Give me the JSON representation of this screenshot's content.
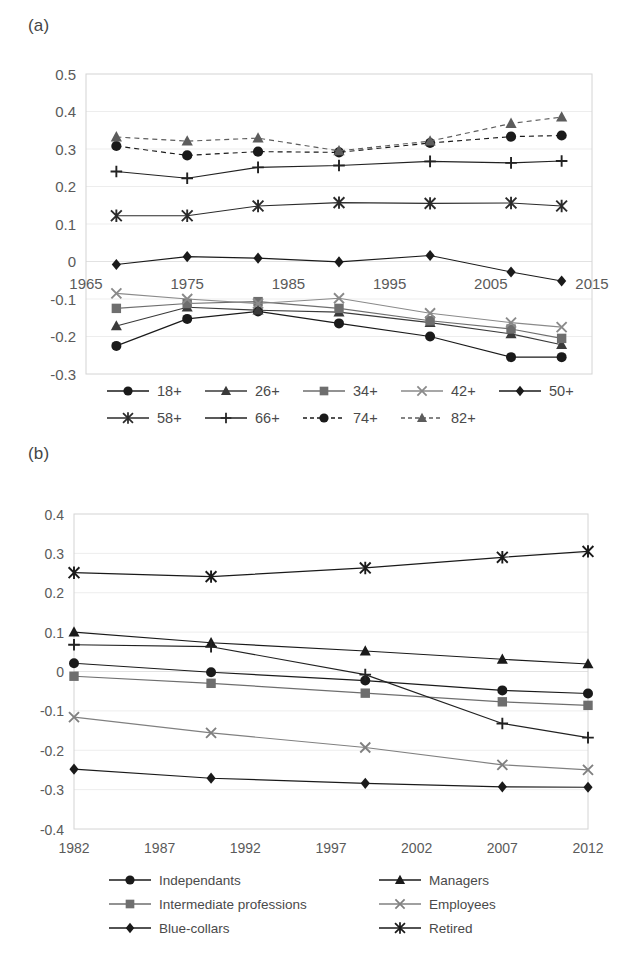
{
  "panels": {
    "a_label": "(a)",
    "b_label": "(b)"
  },
  "chart_data": [
    {
      "id": "chart-a",
      "type": "line",
      "title": "(a)",
      "xlabel": "",
      "ylabel": "",
      "xlim": [
        1965,
        2015
      ],
      "ylim": [
        -0.3,
        0.5
      ],
      "xticks": [
        1965,
        1975,
        1985,
        1995,
        2005,
        2015
      ],
      "xticklabels": [
        "1965",
        "1975",
        "1985",
        "1995",
        "2005",
        "2015"
      ],
      "yticks": [
        -0.3,
        -0.2,
        -0.1,
        0,
        0.1,
        0.2,
        0.3,
        0.4,
        0.5
      ],
      "yticklabels": [
        "-0.3",
        "-0.2",
        "-0.1",
        "0",
        "0.1",
        "0.2",
        "0.3",
        "0.4",
        "0.5"
      ],
      "grid": true,
      "legend_position": "bottom",
      "x": [
        1968,
        1975,
        1982,
        1990,
        1999,
        2007,
        2012
      ],
      "series": [
        {
          "name": "18+",
          "marker": "circle",
          "dash": false,
          "color": "#1a1a1a",
          "values": [
            -0.225,
            -0.153,
            -0.133,
            -0.165,
            -0.2,
            -0.255,
            -0.255
          ]
        },
        {
          "name": "26+",
          "marker": "triangle",
          "dash": false,
          "color": "#3a3a3a",
          "values": [
            -0.172,
            -0.122,
            -0.13,
            -0.135,
            -0.163,
            -0.193,
            -0.222
          ]
        },
        {
          "name": "34+",
          "marker": "square",
          "dash": false,
          "color": "#6e6e6e",
          "values": [
            -0.125,
            -0.112,
            -0.107,
            -0.125,
            -0.158,
            -0.18,
            -0.205
          ]
        },
        {
          "name": "42+",
          "marker": "cross",
          "dash": false,
          "color": "#8a8a8a",
          "values": [
            -0.085,
            -0.1,
            -0.112,
            -0.098,
            -0.138,
            -0.163,
            -0.175
          ]
        },
        {
          "name": "50+",
          "marker": "diamond",
          "dash": false,
          "color": "#1a1a1a",
          "values": [
            -0.008,
            0.013,
            0.009,
            -0.001,
            0.016,
            -0.028,
            -0.052
          ]
        },
        {
          "name": "58+",
          "marker": "star",
          "dash": false,
          "color": "#2b2b2b",
          "values": [
            0.122,
            0.122,
            0.148,
            0.157,
            0.155,
            0.156,
            0.148
          ]
        },
        {
          "name": "66+",
          "marker": "plus",
          "dash": false,
          "color": "#222222",
          "values": [
            0.24,
            0.222,
            0.251,
            0.256,
            0.267,
            0.263,
            0.268
          ]
        },
        {
          "name": "74+",
          "marker": "circle",
          "dash": true,
          "color": "#1a1a1a",
          "values": [
            0.308,
            0.283,
            0.293,
            0.291,
            0.316,
            0.333,
            0.336
          ]
        },
        {
          "name": "82+",
          "marker": "triangle",
          "dash": true,
          "color": "#5c5c5c",
          "values": [
            0.332,
            0.321,
            0.329,
            0.295,
            0.321,
            0.368,
            0.385
          ]
        }
      ]
    },
    {
      "id": "chart-b",
      "type": "line",
      "title": "(b)",
      "xlabel": "",
      "ylabel": "",
      "xlim": [
        1982,
        2012
      ],
      "ylim": [
        -0.4,
        0.4
      ],
      "xticks": [
        1982,
        1987,
        1992,
        1997,
        2002,
        2007,
        2012
      ],
      "xticklabels": [
        "1982",
        "1987",
        "1992",
        "1997",
        "2002",
        "2007",
        "2012"
      ],
      "yticks": [
        -0.4,
        -0.3,
        -0.2,
        -0.1,
        0,
        0.1,
        0.2,
        0.3,
        0.4
      ],
      "yticklabels": [
        "-0.4",
        "-0.3",
        "-0.2",
        "-0.1",
        "0",
        "0.1",
        "0.2",
        "0.3",
        "0.4"
      ],
      "grid": true,
      "legend_position": "bottom",
      "x": [
        1982,
        1990,
        1999,
        2007,
        2012
      ],
      "series": [
        {
          "name": "Independants",
          "marker": "circle",
          "dash": false,
          "color": "#1a1a1a",
          "values": [
            0.021,
            -0.002,
            -0.023,
            -0.048,
            -0.056
          ]
        },
        {
          "name": "Managers",
          "marker": "triangle",
          "dash": false,
          "color": "#1a1a1a",
          "values": [
            0.1,
            0.073,
            0.052,
            0.031,
            0.019
          ]
        },
        {
          "name": "Intermediate professions",
          "marker": "square",
          "dash": false,
          "color": "#6e6e6e",
          "values": [
            -0.012,
            -0.03,
            -0.055,
            -0.077,
            -0.086
          ]
        },
        {
          "name": "Employees",
          "marker": "cross",
          "dash": false,
          "color": "#808080",
          "values": [
            -0.116,
            -0.156,
            -0.193,
            -0.237,
            -0.25
          ]
        },
        {
          "name": "Blue-collars",
          "marker": "diamond",
          "dash": false,
          "color": "#1a1a1a",
          "values": [
            -0.248,
            -0.271,
            -0.284,
            -0.293,
            -0.294
          ]
        },
        {
          "name": "Retired",
          "marker": "star",
          "dash": false,
          "color": "#1a1a1a",
          "values": [
            0.251,
            0.241,
            0.263,
            0.29,
            0.305
          ]
        },
        {
          "name": "",
          "marker": "plus",
          "dash": false,
          "color": "#222222",
          "values": [
            0.068,
            0.063,
            -0.008,
            -0.132,
            -0.168
          ]
        }
      ]
    }
  ]
}
